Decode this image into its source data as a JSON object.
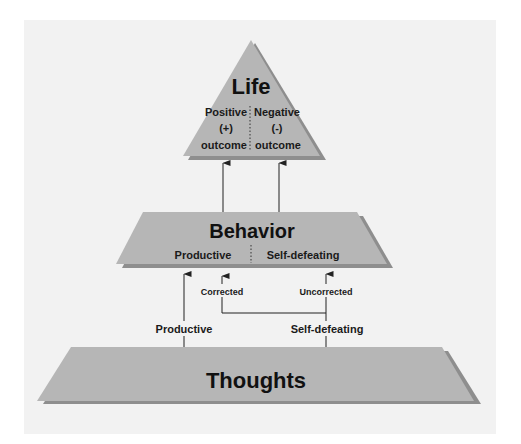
{
  "colors": {
    "page_background": "#ffffff",
    "panel_background": "#f2f2f2",
    "shape_fill": "#b6b6b6",
    "shape_shadow": "#8e8e8e",
    "line": "#222222",
    "text": "#111111"
  },
  "life": {
    "title": "Life",
    "left_column": {
      "line1": "Positive",
      "line2": "(+)",
      "line3": "outcome"
    },
    "right_column": {
      "line1": "Negative",
      "line2": "(-)",
      "line3": "outcome"
    }
  },
  "behavior": {
    "title": "Behavior",
    "left_label": "Productive",
    "right_label": "Self-defeating"
  },
  "thoughts": {
    "title": "Thoughts"
  },
  "connectors": {
    "productive_label": "Productive",
    "self_defeating_label": "Self-defeating",
    "corrected_label": "Corrected",
    "uncorrected_label": "Uncorrected"
  }
}
